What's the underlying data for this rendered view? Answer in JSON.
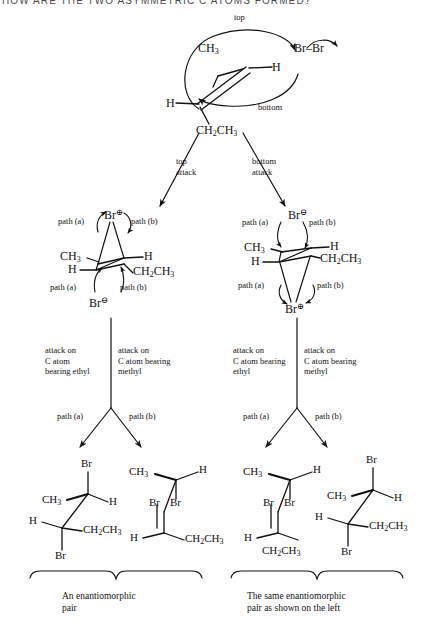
{
  "page": {
    "header_clipped_text": "HOW ARE THE TWO ASYMMETRIC C ATOMS FORMED?",
    "background_color": "#ffffff",
    "ink_color": "#111111"
  },
  "top_scheme": {
    "alkene": {
      "substituents": [
        {
          "name": "methyl",
          "formula": "CH",
          "sub": "3"
        },
        {
          "name": "hydrogen-right",
          "formula": "H",
          "sub": ""
        },
        {
          "name": "hydrogen-left",
          "formula": "H",
          "sub": ""
        },
        {
          "name": "ethyl",
          "formula": "CH",
          "sub": "2",
          "formula2": "CH",
          "sub2": "3"
        }
      ]
    },
    "reagent": {
      "left": "Br",
      "dash": "–",
      "right": "Br"
    },
    "face_labels": {
      "top": "top",
      "bottom": "bottom"
    }
  },
  "branch_arrows": {
    "left": {
      "line1": "top",
      "line2": "attack"
    },
    "right": {
      "line1": "bottom",
      "line2": "attack"
    }
  },
  "intermediates": {
    "left": {
      "name": "bromonium-ion-top-attack",
      "bridging": {
        "label": "Br",
        "charge": "⊕"
      },
      "nucleophile": {
        "label": "Br",
        "charge": "⊖"
      },
      "substituents": {
        "upper_left": "CH",
        "upper_left_sub": "3",
        "upper_right": "H",
        "lower_left": "H",
        "lower_right": "CH",
        "lower_right_sub": "2",
        "lower_right_tail": "CH",
        "lower_right_tail_sub": "3"
      },
      "paths_top": {
        "a": "path (a)",
        "b": "path (b)"
      },
      "paths_bottom": {
        "a": "path (a)",
        "b": "path (b)"
      }
    },
    "right": {
      "name": "bromonium-ion-bottom-attack",
      "bridging": {
        "label": "Br",
        "charge": "⊕"
      },
      "nucleophile": {
        "label": "Br",
        "charge": "⊖"
      },
      "substituents": {
        "upper_left": "CH",
        "upper_left_sub": "3",
        "upper_right": "H",
        "lower_left": "H",
        "lower_right": "CH",
        "lower_right_sub": "2",
        "lower_right_tail": "CH",
        "lower_right_tail_sub": "3"
      },
      "paths_top": {
        "a": "path (a)",
        "b": "path (b)"
      },
      "paths_bottom": {
        "a": "path (a)",
        "b": "path (b)"
      }
    }
  },
  "attack_notes": {
    "left_a": [
      "attack on",
      "C atom",
      "bearing ethyl"
    ],
    "left_b": [
      "attack on",
      "C atom bearing",
      "methyl"
    ],
    "right_a": [
      "attack on",
      "C atom bearing",
      "ethyl"
    ],
    "right_b": [
      "attack on",
      "C atom bearing",
      "methyl"
    ]
  },
  "path_splits": {
    "left": {
      "a": "path (a)",
      "b": "path (b)"
    },
    "right": {
      "a": "path (a)",
      "b": "path (b)"
    }
  },
  "products": [
    {
      "id": "product-1",
      "position": "left-outer",
      "labels": {
        "top": "Br",
        "upper_left": "CH",
        "upper_left_sub": "3",
        "upper_right": "H",
        "lower_left": "H",
        "lower_right": "CH",
        "lower_right_sub": "2",
        "lower_right_tail": "CH",
        "lower_right_tail_sub": "3",
        "bottom": "Br"
      }
    },
    {
      "id": "product-2",
      "position": "left-inner",
      "labels": {
        "upper_left": "CH",
        "upper_left_sub": "3",
        "upper_right": "H",
        "mid_left": "Br",
        "mid_right": "Br",
        "lower_left": "H",
        "lower_right": "CH",
        "lower_right_sub": "2",
        "lower_right_tail": "CH",
        "lower_right_tail_sub": "3"
      }
    },
    {
      "id": "product-3",
      "position": "right-inner",
      "labels": {
        "upper_left": "CH",
        "upper_left_sub": "3",
        "upper_right": "H",
        "mid_left": "Br",
        "mid_right": "Br",
        "lower_left": "H",
        "lower_right": "CH",
        "lower_right_sub": "2",
        "lower_right_tail": "CH",
        "lower_right_tail_sub": "3"
      }
    },
    {
      "id": "product-4",
      "position": "right-outer",
      "labels": {
        "top": "Br",
        "upper_left": "CH",
        "upper_left_sub": "3",
        "upper_right": "H",
        "lower_left": "H",
        "lower_right": "CH",
        "lower_right_sub": "2",
        "lower_right_tail": "CH",
        "lower_right_tail_sub": "3",
        "bottom": "Br"
      }
    }
  ],
  "captions": {
    "left": [
      "An enantiomorphic",
      "pair"
    ],
    "right": [
      "The same enantiomorphic",
      "pair as shown on the left"
    ]
  }
}
